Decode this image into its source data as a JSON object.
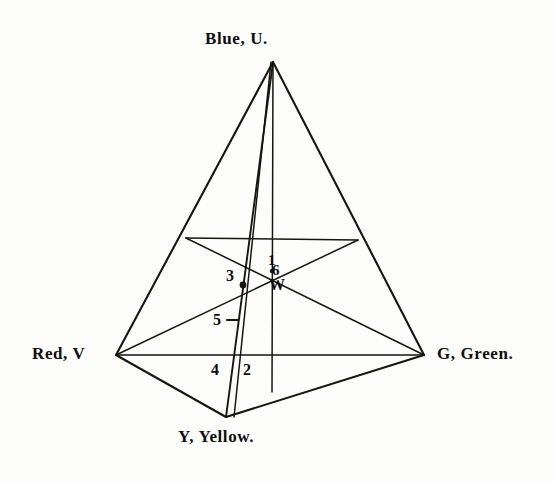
{
  "figure": {
    "kind": "tetrahedron-color-diagram",
    "background_color": "#fdfdfb",
    "ink_color": "#16150f",
    "vertices": [
      {
        "id": "U",
        "name": "vertex-blue",
        "label": "Blue, U.",
        "x": 273,
        "y": 62
      },
      {
        "id": "V",
        "name": "vertex-red",
        "label": "Red, V",
        "x": 116,
        "y": 355
      },
      {
        "id": "G",
        "name": "vertex-green",
        "label": "G, Green.",
        "x": 424,
        "y": 355
      },
      {
        "id": "Y",
        "name": "vertex-yellow",
        "label": "Y, Yellow.",
        "x": 226,
        "y": 417
      }
    ],
    "interior_points": [
      {
        "id": "W",
        "label": "W",
        "x": 272,
        "y": 272
      },
      {
        "id": "1",
        "label": "1",
        "x": 272,
        "y": 262
      },
      {
        "id": "6",
        "label": "6",
        "x": 274,
        "y": 270
      },
      {
        "id": "3",
        "label": "3",
        "x": 243,
        "y": 285,
        "marker": "dot"
      },
      {
        "id": "5",
        "label": "5",
        "x": 230,
        "y": 320,
        "marker": "tick"
      },
      {
        "id": "4",
        "label": "4",
        "x": 219,
        "y": 373
      },
      {
        "id": "2",
        "label": "2",
        "x": 251,
        "y": 373
      }
    ],
    "edge_midpoints": [
      {
        "name": "midpoint-blue-red",
        "x": 186,
        "y": 238
      },
      {
        "name": "midpoint-blue-green",
        "x": 358,
        "y": 240
      }
    ]
  }
}
